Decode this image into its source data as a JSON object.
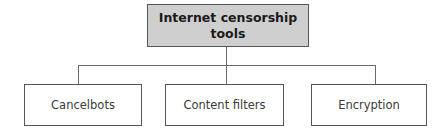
{
  "diagram": {
    "type": "tree",
    "root": {
      "label": "Internet censorship tools",
      "fill": "#cfcfcf"
    },
    "children": [
      {
        "label": "Cancelbots"
      },
      {
        "label": "Content filters"
      },
      {
        "label": "Encryption"
      }
    ],
    "colors": {
      "border": "#555555",
      "connector": "#6a6a6a",
      "background": "#ffffff"
    }
  }
}
